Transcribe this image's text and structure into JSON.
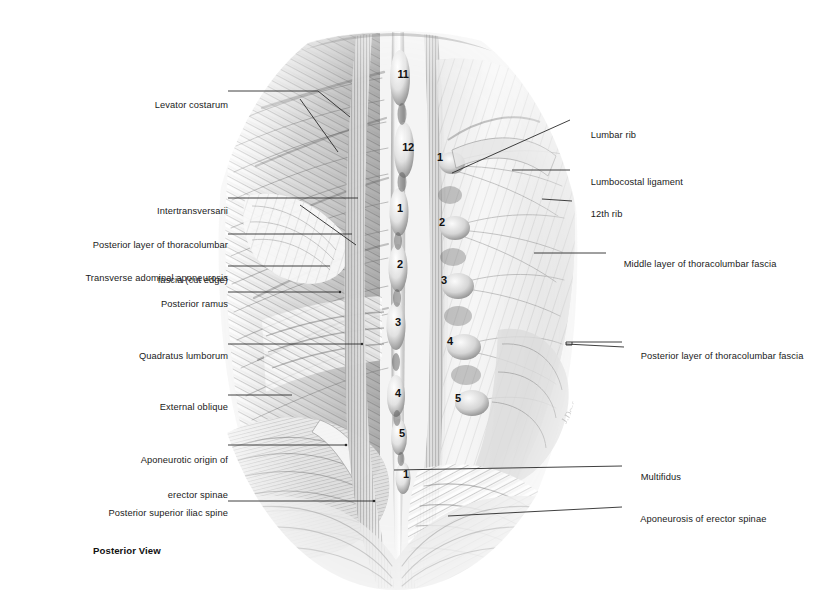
{
  "plate": {
    "caption": "Posterior View",
    "title": "Posterior View",
    "background_color": "#ffffff",
    "ink_color": "#1a1a1a",
    "artist_signature": "J. Dorfbaum"
  },
  "labels_left": [
    {
      "id": "levator-costarum",
      "text": "Levator costarum",
      "x": 236,
      "y": 94
    },
    {
      "id": "intertransversarii",
      "text": "Intertransversarii",
      "x": 236,
      "y": 200
    },
    {
      "id": "posterior-layer-thoracolumbar-fascia-cut-edge",
      "text": "Posterior layer of thoracolumbar",
      "text2": "fascia (cut edge)",
      "x": 236,
      "y": 223
    },
    {
      "id": "transverse-abdominal-aponeurosis",
      "text": "Transverse adominal aponeurosis",
      "x": 236,
      "y": 267
    },
    {
      "id": "posterior-ramus",
      "text": "Posterior ramus",
      "x": 236,
      "y": 293
    },
    {
      "id": "quadratus-lumborum",
      "text": "Quadratus lumborum",
      "x": 236,
      "y": 345
    },
    {
      "id": "external-oblique",
      "text": "External oblique",
      "x": 236,
      "y": 396
    },
    {
      "id": "aponeurotic-origin-of-erector-spinae",
      "text": "Aponeurotic origin of",
      "text2": "erector spinae",
      "x": 236,
      "y": 437
    },
    {
      "id": "posterior-superior-iliac-spine",
      "text": "Posterior superior iliac spine",
      "x": 236,
      "y": 502
    }
  ],
  "labels_right": [
    {
      "id": "lumbar-rib",
      "text": "Lumbar rib",
      "x": 580,
      "y": 124
    },
    {
      "id": "lumbocostal-ligament",
      "text": "Lumbocostal ligament",
      "x": 580,
      "y": 171
    },
    {
      "id": "twelfth-rib",
      "text": "12th rib",
      "x": 580,
      "y": 203
    },
    {
      "id": "middle-layer-of-thoracolumbar-fascia",
      "text": "Middle layer of thoracolumbar fascia",
      "x": 613,
      "y": 253
    },
    {
      "id": "posterior-layer-of-thoracolumbar-fascia",
      "text": "Posterior layer of thoracolumbar fascia",
      "x": 630,
      "y": 345
    },
    {
      "id": "multifidus",
      "text": "Multifidus",
      "x": 630,
      "y": 466
    },
    {
      "id": "aponeurosis-of-erector-spinae",
      "text": "Aponeurosis of erector spinae",
      "x": 630,
      "y": 508
    }
  ],
  "vertebral_numbers_spinous": [
    {
      "label": "11",
      "x": 403,
      "y": 75
    },
    {
      "label": "12",
      "x": 408,
      "y": 148
    },
    {
      "label": "1",
      "x": 400,
      "y": 209
    },
    {
      "label": "2",
      "x": 400,
      "y": 265
    },
    {
      "label": "3",
      "x": 398,
      "y": 323
    },
    {
      "label": "4",
      "x": 398,
      "y": 394
    },
    {
      "label": "5",
      "x": 402,
      "y": 434
    },
    {
      "label": "1",
      "x": 406,
      "y": 475
    }
  ],
  "vertebral_numbers_transverse": [
    {
      "label": "1",
      "x": 440,
      "y": 158
    },
    {
      "label": "2",
      "x": 442,
      "y": 223
    },
    {
      "label": "3",
      "x": 444,
      "y": 281
    },
    {
      "label": "4",
      "x": 450,
      "y": 342
    },
    {
      "label": "5",
      "x": 458,
      "y": 399
    }
  ],
  "leaders_left": [
    {
      "id": "leader-levator-costarum",
      "points": "320,91 330,91"
    },
    {
      "id": "leader-intertransversarii",
      "points": ""
    },
    {
      "id": "leader-posterior-ramus",
      "points": ""
    }
  ],
  "colors": {
    "ink": "#1a1a1a",
    "leader": "#2a2a2a",
    "paper": "#ffffff",
    "drawing_dark": "#6a6a6a",
    "drawing_mid": "#a8a8a8",
    "drawing_light": "#d8d8d8"
  }
}
